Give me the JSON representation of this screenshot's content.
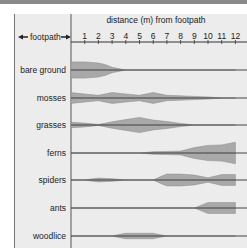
{
  "chart_data": {
    "type": "kite",
    "title": "",
    "xlabel": "distance (m) from footpath",
    "left_label": "footpath",
    "x_ticks": [
      1,
      2,
      3,
      4,
      5,
      6,
      7,
      8,
      9,
      10,
      11,
      12
    ],
    "xlim": [
      0,
      12
    ],
    "fill_color": "#a9a9a9",
    "line_color": "#333333",
    "series": [
      {
        "name": "bare ground",
        "x": [
          0,
          1,
          2,
          2.5,
          3,
          4,
          12
        ],
        "halfwidth": [
          3,
          3,
          2.6,
          2,
          1,
          0,
          0
        ]
      },
      {
        "name": "mosses",
        "x": [
          0,
          1,
          2,
          3,
          4,
          5,
          6,
          7,
          8,
          9,
          10,
          11,
          12
        ],
        "halfwidth": [
          2,
          1.5,
          1,
          2,
          1.5,
          1,
          2,
          1,
          0.8,
          0.6,
          0.4,
          0,
          0
        ]
      },
      {
        "name": "grasses",
        "x": [
          0,
          1,
          2,
          3,
          4,
          5,
          6,
          7,
          8,
          9,
          12
        ],
        "halfwidth": [
          1,
          0.7,
          0.2,
          1.2,
          2,
          2.8,
          1.8,
          1.3,
          0.6,
          0,
          0
        ]
      },
      {
        "name": "ferns",
        "x": [
          0,
          5,
          6,
          7,
          8,
          9,
          10,
          11,
          12
        ],
        "halfwidth": [
          0,
          0,
          0.5,
          0.6,
          0.7,
          2,
          2.8,
          3,
          4
        ]
      },
      {
        "name": "spiders",
        "x": [
          0,
          1,
          1.5,
          2,
          3,
          4,
          5,
          6,
          6.5,
          7,
          8,
          9,
          10,
          11,
          12
        ],
        "halfwidth": [
          0,
          0,
          0.4,
          0.7,
          0.5,
          0,
          0,
          0,
          1.2,
          2.2,
          2.2,
          1.8,
          0.8,
          2,
          2
        ]
      },
      {
        "name": "ants",
        "x": [
          0,
          9,
          10,
          12
        ],
        "halfwidth": [
          0,
          0,
          2,
          2
        ]
      },
      {
        "name": "woodlice",
        "x": [
          0,
          3,
          3.5,
          4,
          6,
          6.5,
          7,
          12
        ],
        "halfwidth": [
          0,
          0,
          0.6,
          1,
          1,
          0.5,
          0,
          0
        ]
      }
    ]
  }
}
